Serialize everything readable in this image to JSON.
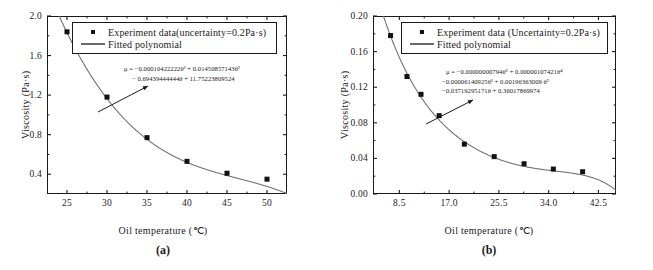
{
  "figure": {
    "panels": [
      {
        "caption": "(a)",
        "xlabel": "Oil temperature (℃)",
        "ylabel": "Viscosity (Pa·s)",
        "legend": {
          "data_label": "Experiment data(uncertainty=0.2Pa·s)",
          "fit_label": "Fitted polynomial"
        },
        "equation_lines": [
          "μ = −0.00010422222θ³ + 0.01450857143θ²",
          "− 0.69439444444θ + 11.75223809524"
        ]
      },
      {
        "caption": "(b)",
        "xlabel": "Oil temperature (℃)",
        "ylabel": "Viscosity (Pa·s)",
        "legend": {
          "data_label": "Experiment data (Uncertainty=0.2Pa·s)",
          "fit_label": "Fitted polynomial"
        },
        "equation_lines": [
          "μ = −0.00000000794θ⁵ + 0.00000107421θ⁴",
          "−0.00006140925θ³ + 0.00196363009 θ²",
          "−0.03719295171θ + 0.36017869974"
        ]
      }
    ]
  },
  "chart_data": [
    {
      "type": "scatter",
      "panel": "(a)",
      "title": "",
      "xlabel": "Oil temperature (℃)",
      "ylabel": "Viscosity (Pa·s)",
      "xlim": [
        22.5,
        52.5
      ],
      "ylim": [
        0.2,
        2.0
      ],
      "xticks": [
        25,
        30,
        35,
        40,
        45,
        50
      ],
      "yticks": [
        0.4,
        0.8,
        1.2,
        1.6,
        2.0
      ],
      "xtick_labels": [
        "25",
        "30",
        "35",
        "40",
        "45",
        "50"
      ],
      "ytick_labels": [
        "0.4",
        "0.8",
        "1.2",
        "1.6",
        "2.0"
      ],
      "grid": false,
      "legend_position": "top-right",
      "series": [
        {
          "name": "Experiment data(uncertainty=0.2Pa·s)",
          "type": "scatter",
          "marker": "square",
          "x": [
            25,
            30,
            35,
            40,
            45,
            50
          ],
          "values": [
            1.84,
            1.18,
            0.77,
            0.53,
            0.41,
            0.35
          ]
        },
        {
          "name": "Fitted polynomial",
          "type": "line",
          "equation": "μ = −0.00010422222θ³ + 0.01450857143θ² − 0.69439444444θ + 11.75223809524",
          "coefficients": [
            -0.00010422222,
            0.01450857143,
            -0.69439444444,
            11.75223809524
          ],
          "degree": 3
        }
      ]
    },
    {
      "type": "scatter",
      "panel": "(b)",
      "title": "",
      "xlabel": "Oil temperature (℃)",
      "ylabel": "Viscosity (Pa·s)",
      "xlim": [
        4.0,
        45.5
      ],
      "ylim": [
        0.0,
        0.2
      ],
      "xticks": [
        8.5,
        17.0,
        25.5,
        34.0,
        42.5
      ],
      "yticks": [
        0.0,
        0.04,
        0.08,
        0.12,
        0.16,
        0.2
      ],
      "xtick_labels": [
        "8.5",
        "17.0",
        "25.5",
        "34.0",
        "42.5"
      ],
      "ytick_labels": [
        "0.00",
        "0.04",
        "0.08",
        "0.12",
        "0.16",
        "0.20"
      ],
      "grid": false,
      "legend_position": "top-right",
      "series": [
        {
          "name": "Experiment data (Uncertainty=0.2Pa·s)",
          "type": "scatter",
          "marker": "square",
          "x": [
            7.0,
            9.8,
            12.2,
            15.3,
            19.6,
            24.7,
            29.8,
            34.8,
            39.8
          ],
          "values": [
            0.178,
            0.132,
            0.112,
            0.088,
            0.056,
            0.042,
            0.034,
            0.028,
            0.025
          ]
        },
        {
          "name": "Fitted polynomial",
          "type": "line",
          "equation": "μ = −0.00000000794θ⁵ + 0.00000107421θ⁴ −0.00006140925θ³ + 0.00196363009θ² −0.03719295171θ + 0.36017869974",
          "coefficients": [
            -7.94e-09,
            1.07421e-06,
            -6.140925e-05,
            0.00196363009,
            -0.03719295171,
            0.36017869974
          ],
          "degree": 5
        }
      ]
    }
  ]
}
